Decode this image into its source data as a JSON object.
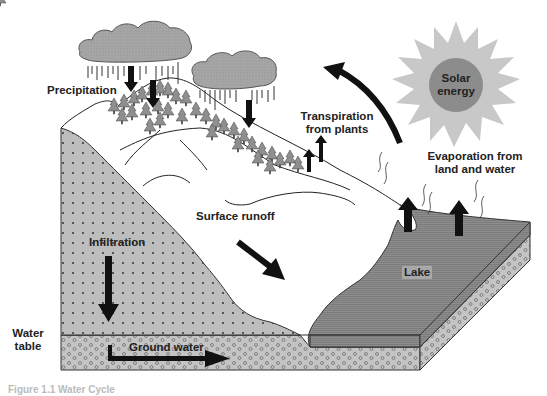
{
  "diagram": {
    "title": "Water cycle",
    "labels": {
      "precipitation": "Precipitation",
      "transpiration_line1": "Transpiration",
      "transpiration_line2": "from plants",
      "solar_line1": "Solar",
      "solar_line2": "energy",
      "evaporation_line1": "Evaporation from",
      "evaporation_line2": "land and water",
      "surface_runoff": "Surface runoff",
      "infiltration": "Infiltration",
      "lake": "Lake",
      "water_table_line1": "Water",
      "water_table_line2": "table",
      "ground_water": "Ground water"
    },
    "caption": "Figure 1.1  Water Cycle",
    "colors": {
      "soil": "#b8b8b8",
      "cloud": "#a8a8a8",
      "lake": "#8c8c8c",
      "sun_rays": "#c4c4c4",
      "sun_core": "#8a8a8a",
      "trees": "#909090",
      "arrows": "#111111"
    }
  }
}
